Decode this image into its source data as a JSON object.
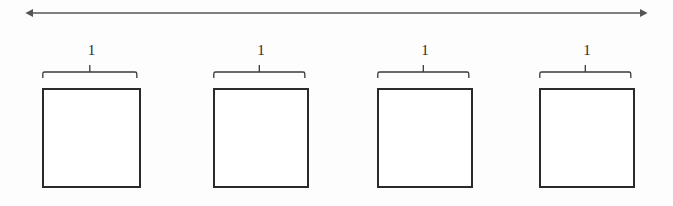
{
  "figure": {
    "canvas": {
      "width": 673,
      "height": 206,
      "background": "#fdfdfd"
    },
    "stroke_color": "#2a2a2a",
    "arrow_color": "#555555",
    "label_color": "#2b2b2b",
    "span_arrow": {
      "name": "total-span-arrow",
      "style": "double-headed",
      "x_start": 32,
      "x_end": 641,
      "y": 13,
      "label": ""
    },
    "units": [
      {
        "id": "unit-1",
        "label": "1",
        "box_left": 42,
        "box_right": 141,
        "box_top": 88,
        "box_bottom": 188,
        "brace_left": 42,
        "brace_right": 137,
        "brace_y": 72
      },
      {
        "id": "unit-2",
        "label": "1",
        "box_left": 213,
        "box_right": 309,
        "box_top": 88,
        "box_bottom": 188,
        "brace_left": 211,
        "brace_right": 306,
        "brace_y": 72
      },
      {
        "id": "unit-3",
        "label": "1",
        "box_left": 377,
        "box_right": 473,
        "box_top": 88,
        "box_bottom": 188,
        "brace_left": 375,
        "brace_right": 470,
        "brace_y": 72
      },
      {
        "id": "unit-4",
        "label": "1",
        "box_left": 539,
        "box_right": 635,
        "box_top": 88,
        "box_bottom": 188,
        "brace_left": 537,
        "brace_right": 632,
        "brace_y": 72
      }
    ]
  }
}
